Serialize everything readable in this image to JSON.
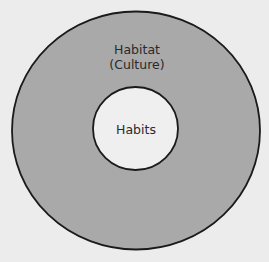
{
  "diagram": {
    "type": "nested-circles",
    "outer": {
      "title": "Habitat",
      "subtitle": "(Culture)",
      "fill": "#a9a9a9",
      "stroke": "#1a1a1a"
    },
    "inner": {
      "title": "Habits",
      "fill": "#efefef",
      "stroke": "#1a1a1a"
    },
    "background": "#ececec"
  }
}
